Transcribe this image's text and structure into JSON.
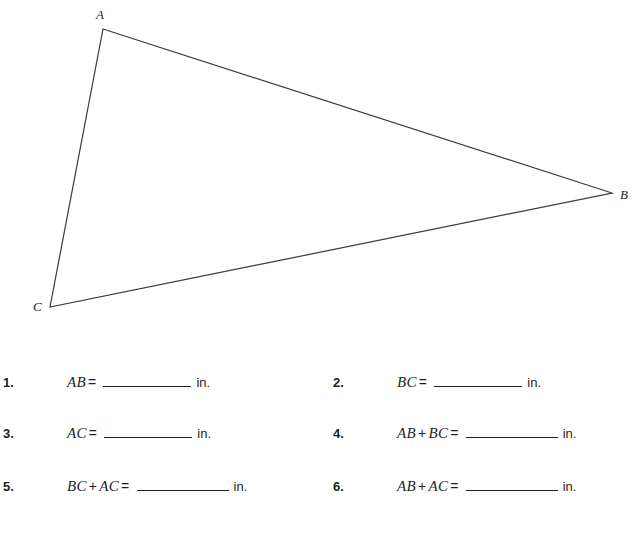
{
  "figure": {
    "name": "triangle-ABC",
    "stroke_color": "#3a3a3a",
    "vertices": [
      {
        "label": "A",
        "x": 103,
        "y": 29
      },
      {
        "label": "B",
        "x": 612,
        "y": 193
      },
      {
        "label": "C",
        "x": 50,
        "y": 307
      }
    ],
    "label_A": "A",
    "label_B": "B",
    "label_C": "C"
  },
  "exercises": [
    {
      "number": "1.",
      "expr_left": "AB",
      "operator": "",
      "expr_right": "",
      "equals": "=",
      "answer": "",
      "unit": "in."
    },
    {
      "number": "2.",
      "expr_left": "BC",
      "operator": "",
      "expr_right": "",
      "equals": "=",
      "answer": "",
      "unit": "in."
    },
    {
      "number": "3.",
      "expr_left": "AC",
      "operator": "",
      "expr_right": "",
      "equals": "=",
      "answer": "",
      "unit": "in."
    },
    {
      "number": "4.",
      "expr_left": "AB",
      "operator": "+",
      "expr_right": "BC",
      "equals": "=",
      "answer": "",
      "unit": "in."
    },
    {
      "number": "5.",
      "expr_left": "BC",
      "operator": "+",
      "expr_right": "AC",
      "equals": "=",
      "answer": "",
      "unit": "in."
    },
    {
      "number": "6.",
      "expr_left": "AB",
      "operator": "+",
      "expr_right": "AC",
      "equals": "=",
      "answer": "",
      "unit": "in."
    }
  ]
}
